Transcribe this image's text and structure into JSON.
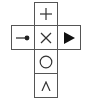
{
  "diagram": {
    "line_color": "#555555",
    "symbol_color": "#333333",
    "cells": [
      {
        "id": "top",
        "symbol": "+",
        "icon": "plus-icon"
      },
      {
        "id": "left",
        "symbol": "⊸",
        "icon": "pin-line-icon"
      },
      {
        "id": "center",
        "symbol": "×",
        "icon": "cross-icon"
      },
      {
        "id": "right",
        "symbol": "▶",
        "icon": "play-triangle-icon"
      },
      {
        "id": "lower",
        "symbol": "○",
        "icon": "circle-icon"
      },
      {
        "id": "bottom",
        "symbol": "∧",
        "icon": "caret-up-icon"
      }
    ]
  }
}
